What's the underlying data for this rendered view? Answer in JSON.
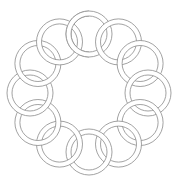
{
  "figure": {
    "ring_count": 12,
    "center": [
      89,
      93
    ],
    "orbit_radius": 59,
    "ring_outer_radius": 23,
    "ring_inner_radius": 18,
    "colors": {
      "background": "#ffffff",
      "ring_fill": "#ffffff",
      "ring_stroke": "#8a8a8a"
    }
  }
}
